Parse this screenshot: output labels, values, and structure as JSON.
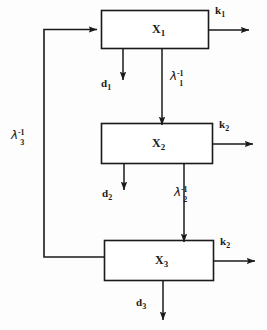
{
  "diagram": {
    "stroke_color": "#1a1a1a",
    "background_color": "#fdfdfd",
    "blocks": [
      {
        "id": "x1",
        "label": "X",
        "subscript": "1",
        "x": 101,
        "y": 10,
        "w": 107,
        "h": 38
      },
      {
        "id": "x2",
        "label": "X",
        "subscript": "2",
        "x": 101,
        "y": 123,
        "w": 111,
        "h": 40
      },
      {
        "id": "x3",
        "label": "X",
        "subscript": "3",
        "x": 104,
        "y": 240,
        "w": 109,
        "h": 40
      }
    ],
    "outputs": [
      {
        "id": "k1",
        "label": "k",
        "subscript": "1",
        "from_block": "x1"
      },
      {
        "id": "k2a",
        "label": "k",
        "subscript": "2",
        "from_block": "x2"
      },
      {
        "id": "k2b",
        "label": "k",
        "subscript": "2",
        "from_block": "x3"
      }
    ],
    "losses": [
      {
        "id": "d1",
        "label": "d",
        "subscript": "1",
        "from_block": "x1"
      },
      {
        "id": "d2",
        "label": "d",
        "subscript": "2",
        "from_block": "x2"
      },
      {
        "id": "d3",
        "label": "d",
        "subscript": "3",
        "from_block": "x3"
      }
    ],
    "transfers": [
      {
        "id": "lambda1",
        "label": "λ",
        "superscript": "-1",
        "subscript": "1",
        "from_block": "x1",
        "to_block": "x2"
      },
      {
        "id": "lambda2",
        "label": "λ",
        "superscript": "-1",
        "subscript": "2",
        "from_block": "x2",
        "to_block": "x3"
      },
      {
        "id": "lambda3",
        "label": "λ",
        "superscript": "-1",
        "subscript": "3",
        "from_block": "x3",
        "to_block": "x1"
      }
    ]
  }
}
